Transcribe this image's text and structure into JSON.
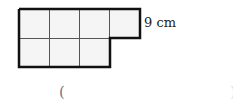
{
  "figure": {
    "top_row_cells": 4,
    "bottom_row_cells": 3,
    "dimension_label": "9 cm"
  },
  "answer_blank": {
    "open_paren": "(",
    "close_paren": ")"
  }
}
